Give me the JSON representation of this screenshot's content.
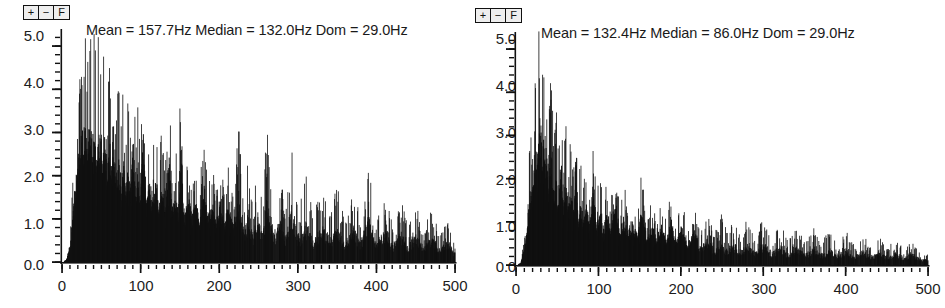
{
  "panels": [
    {
      "id": "left-spectrum-panel",
      "toolbar": {
        "zoom_in_label": "+",
        "zoom_out_label": "−",
        "fit_label": "F"
      },
      "title": "Mean = 157.7Hz Median = 132.0Hz Dom = 29.0Hz",
      "stats": {
        "mean_label": "Mean",
        "mean_value": "157.7Hz",
        "median_label": "Median",
        "median_value": "132.0Hz",
        "dominant_label": "Dom",
        "dominant_value": "29.0Hz"
      },
      "y_ticks": [
        "5.0",
        "4.0",
        "3.0",
        "2.0",
        "1.0",
        "0.0"
      ],
      "x_ticks": [
        "0",
        "100",
        "200",
        "300",
        "400",
        "500"
      ],
      "chart_data": {
        "type": "bar",
        "title": "Mean = 157.7Hz Median = 132.0Hz Dom = 29.0Hz",
        "xlabel": "",
        "ylabel": "",
        "xlim": [
          0,
          500
        ],
        "ylim": [
          0,
          5.3
        ],
        "grid": false,
        "legend": "none",
        "x_tick_values": [
          0,
          100,
          200,
          300,
          400,
          500
        ],
        "y_tick_values": [
          0.0,
          1.0,
          2.0,
          3.0,
          4.0,
          5.0
        ],
        "minor_ticks": true,
        "bar_color": "#111111",
        "dominant_frequency_hz": 29.0,
        "mean_frequency_hz": 157.7,
        "median_frequency_hz": 132.0,
        "envelope_description": "Dense broadband line spectrum; onset near 10 Hz, peak amplitude ~5.0 between 25 and 55 Hz, dense harmonic picket structure out to ~200 Hz, then decaying noise floor to 500 Hz.",
        "x": [
          5,
          10,
          14,
          18,
          22,
          25,
          28,
          29,
          31,
          33,
          35,
          37,
          39,
          41,
          43,
          45,
          47,
          49,
          51,
          54,
          57,
          60,
          63,
          66,
          69,
          72,
          75,
          78,
          81,
          84,
          87,
          90,
          93,
          96,
          99,
          103,
          107,
          111,
          115,
          119,
          123,
          127,
          131,
          135,
          139,
          143,
          147,
          151,
          155,
          160,
          165,
          170,
          175,
          180,
          185,
          190,
          195,
          200,
          206,
          212,
          218,
          224,
          230,
          236,
          242,
          248,
          254,
          260,
          268,
          276,
          284,
          292,
          300,
          310,
          320,
          330,
          340,
          350,
          360,
          370,
          380,
          390,
          400,
          410,
          420,
          430,
          440,
          450,
          460,
          470,
          480,
          490,
          498
        ],
        "values": [
          0.15,
          0.62,
          1.95,
          3.25,
          4.05,
          4.35,
          4.72,
          5.05,
          4.35,
          4.95,
          4.55,
          5.0,
          4.2,
          4.85,
          3.9,
          4.6,
          4.15,
          4.95,
          3.7,
          4.3,
          3.55,
          4.1,
          3.25,
          3.85,
          2.95,
          3.6,
          2.8,
          3.95,
          2.6,
          3.3,
          2.45,
          4.35,
          2.35,
          3.05,
          2.25,
          4.4,
          2.1,
          2.85,
          2.0,
          3.25,
          1.95,
          2.7,
          1.85,
          4.05,
          1.75,
          2.55,
          1.7,
          3.95,
          1.6,
          2.4,
          1.55,
          2.3,
          1.5,
          2.75,
          1.45,
          2.2,
          1.4,
          2.15,
          1.35,
          2.05,
          1.3,
          2.95,
          1.25,
          1.95,
          1.2,
          1.9,
          1.15,
          2.75,
          1.1,
          1.8,
          1.05,
          2.5,
          1.0,
          1.7,
          0.95,
          1.6,
          0.9,
          1.55,
          0.85,
          1.45,
          0.8,
          1.95,
          0.78,
          1.35,
          0.72,
          1.3,
          0.68,
          1.2,
          0.62,
          1.1,
          0.55,
          0.95,
          0.4
        ]
      }
    },
    {
      "id": "right-spectrum-panel",
      "toolbar": {
        "zoom_in_label": "+",
        "zoom_out_label": "−",
        "fit_label": "F"
      },
      "title": "Mean = 132.4Hz Median = 86.0Hz Dom = 29.0Hz",
      "stats": {
        "mean_label": "Mean",
        "mean_value": "132.4Hz",
        "median_label": "Median",
        "median_value": "86.0Hz",
        "dominant_label": "Dom",
        "dominant_value": "29.0Hz"
      },
      "y_ticks": [
        "5.0",
        "4.0",
        "3.0",
        "2.0",
        "1.0",
        "0.0"
      ],
      "x_ticks": [
        "0",
        "100",
        "200",
        "300",
        "400",
        "500"
      ],
      "chart_data": {
        "type": "bar",
        "title": "Mean = 132.4Hz Median = 86.0Hz Dom = 29.0Hz",
        "xlabel": "",
        "ylabel": "",
        "xlim": [
          0,
          500
        ],
        "ylim": [
          0,
          5.3
        ],
        "grid": false,
        "legend": "none",
        "x_tick_values": [
          0,
          100,
          200,
          300,
          400,
          500
        ],
        "y_tick_values": [
          0.0,
          1.0,
          2.0,
          3.0,
          4.0,
          5.0
        ],
        "minor_ticks": true,
        "bar_color": "#111111",
        "dominant_frequency_hz": 29.0,
        "mean_frequency_hz": 132.4,
        "median_frequency_hz": 86.0,
        "envelope_description": "Narrow low-frequency dominated line spectrum; sharp peak ~5.1 near 29-35 Hz, rapid roll-off after 70 Hz, sparse low peaks from 150 Hz, shallow noise floor beyond 250 Hz.",
        "x": [
          5,
          9,
          13,
          17,
          20,
          23,
          26,
          29,
          31,
          33,
          35,
          37,
          39,
          42,
          45,
          48,
          51,
          54,
          57,
          60,
          63,
          66,
          69,
          72,
          75,
          78,
          81,
          85,
          89,
          93,
          97,
          101,
          105,
          110,
          115,
          120,
          125,
          130,
          135,
          140,
          146,
          152,
          158,
          164,
          170,
          176,
          182,
          188,
          194,
          200,
          208,
          216,
          224,
          232,
          240,
          248,
          256,
          264,
          272,
          280,
          290,
          300,
          310,
          320,
          330,
          340,
          350,
          360,
          370,
          380,
          390,
          400,
          410,
          420,
          430,
          440,
          450,
          460,
          470,
          480,
          490,
          498
        ],
        "values": [
          0.12,
          0.5,
          1.4,
          2.6,
          3.2,
          3.9,
          4.4,
          5.1,
          4.0,
          5.05,
          3.6,
          4.45,
          2.95,
          3.85,
          2.6,
          3.3,
          2.35,
          4.0,
          2.2,
          3.05,
          2.0,
          2.6,
          1.85,
          3.55,
          1.7,
          2.3,
          1.6,
          2.15,
          1.5,
          2.85,
          1.4,
          2.0,
          1.3,
          1.85,
          1.25,
          2.45,
          1.15,
          1.7,
          1.1,
          1.55,
          1.05,
          1.95,
          0.95,
          1.45,
          0.9,
          1.4,
          0.85,
          1.6,
          0.8,
          1.3,
          0.75,
          1.2,
          0.7,
          1.15,
          0.65,
          1.05,
          0.62,
          0.95,
          0.58,
          0.9,
          0.55,
          1.0,
          0.52,
          0.85,
          0.48,
          0.8,
          0.45,
          0.75,
          0.42,
          0.7,
          0.4,
          0.68,
          0.38,
          0.62,
          0.35,
          0.58,
          0.32,
          0.55,
          0.3,
          0.5,
          0.26,
          0.22
        ]
      }
    }
  ]
}
